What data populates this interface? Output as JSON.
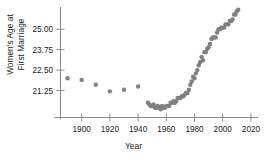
{
  "chart_data": {
    "type": "scatter",
    "title": "",
    "xlabel": "Year",
    "ylabel": "Women's Age at First Marriage",
    "ylabel_lines": [
      "Women's Age at",
      "First Marriage"
    ],
    "xlim": [
      1885,
      2025
    ],
    "ylim": [
      19.6,
      26.3
    ],
    "grid": false,
    "legend": "none",
    "marker": {
      "shape": "circle",
      "color": "#808080",
      "size": 2.2
    },
    "xticks": [
      1900,
      1920,
      1940,
      1960,
      1980,
      2000,
      2020
    ],
    "xtick_labels": [
      "1900",
      "1920",
      "1940",
      "1960",
      "1980",
      "2000",
      "2020"
    ],
    "yticks": [
      21.25,
      22.5,
      23.75,
      25.0
    ],
    "ytick_labels": [
      "21.25",
      "22.50",
      "23.75",
      "25.00"
    ],
    "series": [
      {
        "name": "Median age at first marriage (women)",
        "x": [
          1890,
          1900,
          1910,
          1920,
          1930,
          1940,
          1947,
          1948,
          1949,
          1950,
          1951,
          1952,
          1953,
          1954,
          1955,
          1956,
          1957,
          1958,
          1959,
          1960,
          1961,
          1962,
          1963,
          1964,
          1965,
          1966,
          1967,
          1968,
          1969,
          1970,
          1971,
          1972,
          1973,
          1974,
          1975,
          1976,
          1977,
          1978,
          1979,
          1980,
          1981,
          1982,
          1983,
          1984,
          1985,
          1986,
          1987,
          1988,
          1989,
          1990,
          1991,
          1992,
          1993,
          1994,
          1995,
          1996,
          1997,
          1998,
          1999,
          2000,
          2001,
          2002,
          2003,
          2004,
          2005,
          2006,
          2007,
          2008,
          2009,
          2010,
          2011
        ],
        "y": [
          22.0,
          21.9,
          21.6,
          21.2,
          21.3,
          21.5,
          20.5,
          20.4,
          20.3,
          20.3,
          20.4,
          20.2,
          20.2,
          20.3,
          20.2,
          20.1,
          20.3,
          20.2,
          20.2,
          20.3,
          20.3,
          20.3,
          20.5,
          20.5,
          20.6,
          20.5,
          20.6,
          20.8,
          20.8,
          20.8,
          20.9,
          20.9,
          21.0,
          21.1,
          21.1,
          21.3,
          21.6,
          21.8,
          22.1,
          22.0,
          22.3,
          22.5,
          22.8,
          23.0,
          23.3,
          23.1,
          23.6,
          23.6,
          23.8,
          23.9,
          24.1,
          24.4,
          24.5,
          24.5,
          24.5,
          24.8,
          25.0,
          25.0,
          25.1,
          25.1,
          25.1,
          25.3,
          25.3,
          25.3,
          25.5,
          25.5,
          25.6,
          25.9,
          25.9,
          26.1,
          26.2
        ]
      }
    ]
  },
  "axes": {
    "x_axis_name": "year-axis",
    "y_axis_name": "age-axis"
  }
}
